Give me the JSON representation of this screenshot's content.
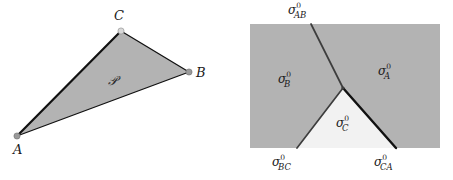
{
  "figure": {
    "width": 453,
    "height": 180,
    "background": "#ffffff"
  },
  "colors": {
    "gray_fill": "#b3b3b3",
    "white_fill": "#f2f2f2",
    "stroke_dark": "#111111",
    "stroke_medium": "#3d3d3d",
    "vertex_dot": "#9a9a9a",
    "text": "#1a1a1a"
  },
  "left_panel": {
    "name": "triangle-domain-panel",
    "region_label": {
      "text": "𝒫",
      "x": 108,
      "y": 73
    },
    "vertices": [
      {
        "id": "A",
        "label": "A",
        "x": 17,
        "y": 136,
        "label_x": 13,
        "label_y": 143
      },
      {
        "id": "B",
        "label": "B",
        "x": 189,
        "y": 72,
        "label_x": 196,
        "label_y": 66
      },
      {
        "id": "C",
        "label": "C",
        "x": 121,
        "y": 31,
        "label_x": 114,
        "label_y": 9
      }
    ],
    "edges": [
      {
        "id": "AC",
        "from": "A",
        "to": "C",
        "weight": 2.2
      },
      {
        "id": "CB",
        "from": "C",
        "to": "B",
        "weight": 1.3
      },
      {
        "id": "AB",
        "from": "A",
        "to": "B",
        "weight": 1.3
      }
    ]
  },
  "right_panel": {
    "name": "triple-junction-panel",
    "rect": {
      "x": 24,
      "y": 24,
      "width": 190,
      "height": 124
    },
    "junction": {
      "x": 117,
      "y": 88
    },
    "branches": [
      {
        "id": "AB",
        "name": "boundary-sigma-AB",
        "to_x": 85,
        "to_y": 24,
        "weight": 1.7,
        "color": "#3d3d3d",
        "label": {
          "sigma": "σ",
          "sup": "0",
          "sub": "AB",
          "x": 62,
          "y": 3
        }
      },
      {
        "id": "BC",
        "name": "boundary-sigma-BC",
        "to_x": 71,
        "to_y": 148,
        "weight": 1.7,
        "color": "#3d3d3d",
        "label": {
          "sigma": "σ",
          "sup": "0",
          "sub": "BC",
          "x": 46,
          "y": 155
        }
      },
      {
        "id": "CA",
        "name": "boundary-sigma-CA",
        "to_x": 170,
        "to_y": 148,
        "weight": 2.4,
        "color": "#111111",
        "label": {
          "sigma": "σ",
          "sup": "0",
          "sub": "CA",
          "x": 148,
          "y": 155
        }
      }
    ],
    "regions": [
      {
        "id": "B",
        "name": "region-sigma-B",
        "fill": "#b3b3b3",
        "label": {
          "sigma": "σ",
          "sup": "0",
          "sub": "B",
          "x": 52,
          "y": 72
        }
      },
      {
        "id": "A",
        "name": "region-sigma-A",
        "fill": "#b3b3b3",
        "label": {
          "sigma": "σ",
          "sup": "0",
          "sub": "A",
          "x": 152,
          "y": 64
        }
      },
      {
        "id": "C",
        "name": "region-sigma-C",
        "fill": "#f2f2f2",
        "label": {
          "sigma": "σ",
          "sup": "0",
          "sub": "C",
          "x": 110,
          "y": 116
        }
      }
    ]
  }
}
